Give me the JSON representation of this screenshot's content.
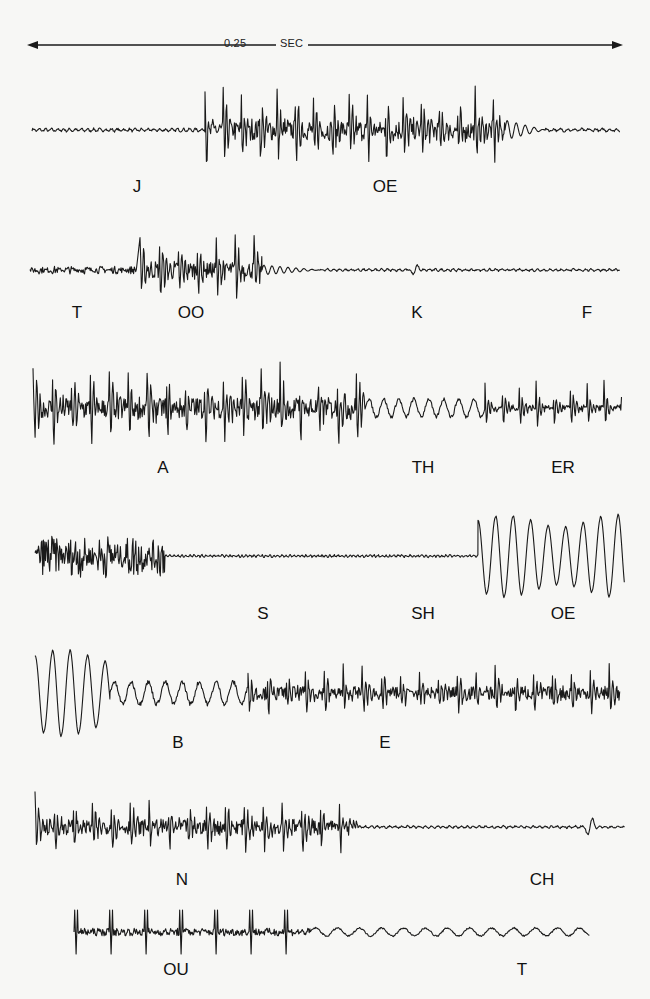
{
  "figure": {
    "type": "speech waveform oscillograms",
    "scale_bar": {
      "value": "0.25",
      "unit": "SEC",
      "y": 45,
      "x_start": 30,
      "x_end": 622,
      "value_x": 226,
      "unit_x": 281
    },
    "traces": [
      {
        "id": 1,
        "baseline_y": 130,
        "segments": [
          {
            "x0": 32,
            "x1": 205,
            "amp": 2,
            "period": 6,
            "kind": "quiet"
          },
          {
            "x0": 205,
            "x1": 505,
            "amp": 40,
            "period": 18,
            "kind": "voiced-dense"
          },
          {
            "x0": 505,
            "x1": 545,
            "amp": 10,
            "period": 9,
            "kind": "decay"
          },
          {
            "x0": 545,
            "x1": 620,
            "amp": 2,
            "period": 7,
            "kind": "quiet"
          }
        ],
        "labels": [
          {
            "text": "J",
            "x": 137,
            "y": 178
          },
          {
            "text": "OE",
            "x": 385,
            "y": 178
          }
        ]
      },
      {
        "id": 2,
        "baseline_y": 270,
        "segments": [
          {
            "x0": 30,
            "x1": 137,
            "amp": 4,
            "period": 5,
            "kind": "noise"
          },
          {
            "x0": 140,
            "x1": 262,
            "amp": 35,
            "period": 19,
            "kind": "voiced-dense"
          },
          {
            "x0": 262,
            "x1": 320,
            "amp": 5,
            "period": 8,
            "kind": "decay"
          },
          {
            "x0": 320,
            "x1": 620,
            "amp": 1.5,
            "period": 6,
            "kind": "quiet"
          }
        ],
        "blips": [
          {
            "x": 415,
            "amp": 6
          }
        ],
        "labels": [
          {
            "text": "T",
            "x": 77,
            "y": 304
          },
          {
            "text": "OO",
            "x": 191,
            "y": 304
          },
          {
            "text": "K",
            "x": 417,
            "y": 304
          },
          {
            "text": "F",
            "x": 587,
            "y": 304
          }
        ]
      },
      {
        "id": 3,
        "baseline_y": 408,
        "segments": [
          {
            "x0": 33,
            "x1": 365,
            "amp": 44,
            "period": 19,
            "kind": "voiced-dense"
          },
          {
            "x0": 365,
            "x1": 485,
            "amp": 9,
            "period": 15,
            "kind": "wobble"
          },
          {
            "x0": 485,
            "x1": 622,
            "amp": 25,
            "period": 17,
            "kind": "voiced"
          }
        ],
        "labels": [
          {
            "text": "A",
            "x": 163,
            "y": 459
          },
          {
            "text": "TH",
            "x": 423,
            "y": 459
          },
          {
            "text": "ER",
            "x": 563,
            "y": 459
          }
        ]
      },
      {
        "id": 4,
        "baseline_y": 556,
        "segments": [
          {
            "x0": 35,
            "x1": 165,
            "amp": 22,
            "period": 9,
            "kind": "noise"
          },
          {
            "x0": 165,
            "x1": 478,
            "amp": 1.5,
            "period": 4,
            "kind": "quiet"
          },
          {
            "x0": 478,
            "x1": 625,
            "amp": 42,
            "period": 17.5,
            "kind": "voiced-big"
          }
        ],
        "labels": [
          {
            "text": "S",
            "x": 263,
            "y": 605
          },
          {
            "text": "SH",
            "x": 423,
            "y": 605
          },
          {
            "text": "OE",
            "x": 563,
            "y": 605
          }
        ]
      },
      {
        "id": 5,
        "baseline_y": 693,
        "segments": [
          {
            "x0": 35,
            "x1": 110,
            "amp": 44,
            "period": 17.5,
            "kind": "voiced-big"
          },
          {
            "x0": 110,
            "x1": 248,
            "amp": 11,
            "period": 17,
            "kind": "wobble"
          },
          {
            "x0": 248,
            "x1": 620,
            "amp": 26,
            "period": 19,
            "kind": "voiced-dense"
          }
        ],
        "labels": [
          {
            "text": "B",
            "x": 178,
            "y": 734
          },
          {
            "text": "E",
            "x": 385,
            "y": 734
          }
        ]
      },
      {
        "id": 6,
        "baseline_y": 827,
        "segments": [
          {
            "x0": 35,
            "x1": 358,
            "amp": 30,
            "period": 19,
            "kind": "voiced-dense"
          },
          {
            "x0": 358,
            "x1": 625,
            "amp": 1.5,
            "period": 6,
            "kind": "quiet"
          }
        ],
        "blips": [
          {
            "x": 590,
            "amp": 12
          }
        ],
        "labels": [
          {
            "text": "N",
            "x": 182,
            "y": 871
          },
          {
            "text": "CH",
            "x": 542,
            "y": 871
          }
        ]
      },
      {
        "id": 7,
        "baseline_y": 932,
        "segments": [
          {
            "x0": 74,
            "x1": 310,
            "amp": 22,
            "period": 35,
            "kind": "spiky"
          },
          {
            "x0": 310,
            "x1": 590,
            "amp": 4,
            "period": 22,
            "kind": "wobble"
          }
        ],
        "labels": [
          {
            "text": "OU",
            "x": 176,
            "y": 961
          },
          {
            "text": "T",
            "x": 522,
            "y": 961
          }
        ]
      }
    ],
    "colors": {
      "background": "#f7f7f5",
      "ink": "#1a1a1a"
    }
  }
}
